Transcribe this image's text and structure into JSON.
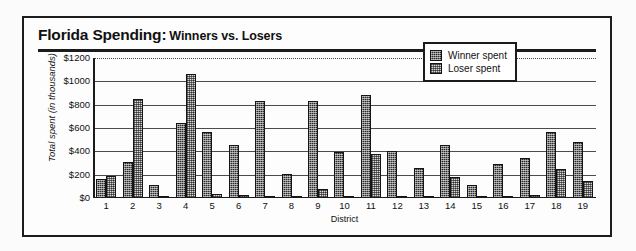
{
  "title": {
    "main": "Florida Spending:",
    "sub": "Winners vs. Losers"
  },
  "legend": {
    "position": "inside-top-right",
    "items": [
      {
        "label": "Winner spent",
        "swatch": "dark-crosshatch-swatch"
      },
      {
        "label": "Loser spent",
        "swatch": "light-checker-swatch"
      }
    ]
  },
  "axes": {
    "ylabel": "Total spent (in thousands)",
    "xlabel": "District",
    "yticks": [
      "$0",
      "$200",
      "$400",
      "$600",
      "$800",
      "$1000",
      "$1200"
    ]
  },
  "colors": {
    "winner": "#2a2a2a",
    "loser": "#d8d8d8",
    "frame": "#1c1c1c",
    "grid": "#4b4b4b"
  },
  "chart_data": {
    "type": "bar",
    "subtitle": "",
    "xlabel": "District",
    "ylabel": "Total spent (in thousands)",
    "categories": [
      "1",
      "2",
      "3",
      "4",
      "5",
      "6",
      "7",
      "8",
      "9",
      "10",
      "11",
      "12",
      "13",
      "14",
      "15",
      "16",
      "17",
      "18",
      "19"
    ],
    "ylim": [
      0,
      1200
    ],
    "ytick_values": [
      0,
      200,
      400,
      600,
      800,
      1000,
      1200
    ],
    "grid": true,
    "legend_position": "upper right",
    "series": [
      {
        "name": "Winner spent",
        "values": [
          160,
          310,
          110,
          640,
          570,
          455,
          835,
          205,
          835,
          395,
          880,
          400,
          255,
          455,
          110,
          295,
          345,
          570,
          480
        ]
      },
      {
        "name": "Loser spent",
        "values": [
          190,
          850,
          20,
          1060,
          35,
          25,
          0,
          0,
          80,
          5,
          375,
          0,
          0,
          180,
          0,
          0,
          25,
          245,
          150
        ]
      }
    ]
  }
}
